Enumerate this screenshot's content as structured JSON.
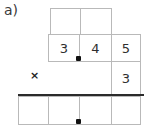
{
  "problem": {
    "part_label": "a)",
    "operator_symbol": "×"
  },
  "grid": {
    "row1": {
      "cells": [
        {
          "value": "",
          "x": 50,
          "y": 8,
          "w": 31,
          "h": 27
        },
        {
          "value": "",
          "x": 80,
          "y": 8,
          "w": 32,
          "h": 27
        }
      ]
    },
    "row2": {
      "cells": [
        {
          "value": "3",
          "x": 48,
          "y": 34,
          "w": 32,
          "h": 28
        },
        {
          "value": "4",
          "x": 79,
          "y": 34,
          "w": 33,
          "h": 28
        },
        {
          "value": "5",
          "x": 111,
          "y": 34,
          "w": 30,
          "h": 28
        }
      ]
    },
    "row3": {
      "cells": [
        {
          "value": "3",
          "x": 111,
          "y": 61,
          "w": 30,
          "h": 34
        }
      ]
    },
    "row4": {
      "cells": [
        {
          "value": "",
          "x": 18,
          "y": 96,
          "w": 31,
          "h": 29
        },
        {
          "value": "",
          "x": 48,
          "y": 96,
          "w": 32,
          "h": 29
        },
        {
          "value": "",
          "x": 79,
          "y": 96,
          "w": 33,
          "h": 29
        },
        {
          "value": "",
          "x": 111,
          "y": 96,
          "w": 30,
          "h": 29
        }
      ]
    },
    "decimal_points": [
      {
        "name": "decimal-point-multiplicand",
        "x": 76,
        "y": 56
      },
      {
        "name": "decimal-point-product",
        "x": 76,
        "y": 119
      }
    ],
    "answer_rule": {
      "x": 18,
      "y": 94,
      "w": 126
    },
    "operator_position": {
      "x": 30,
      "y": 70
    }
  }
}
